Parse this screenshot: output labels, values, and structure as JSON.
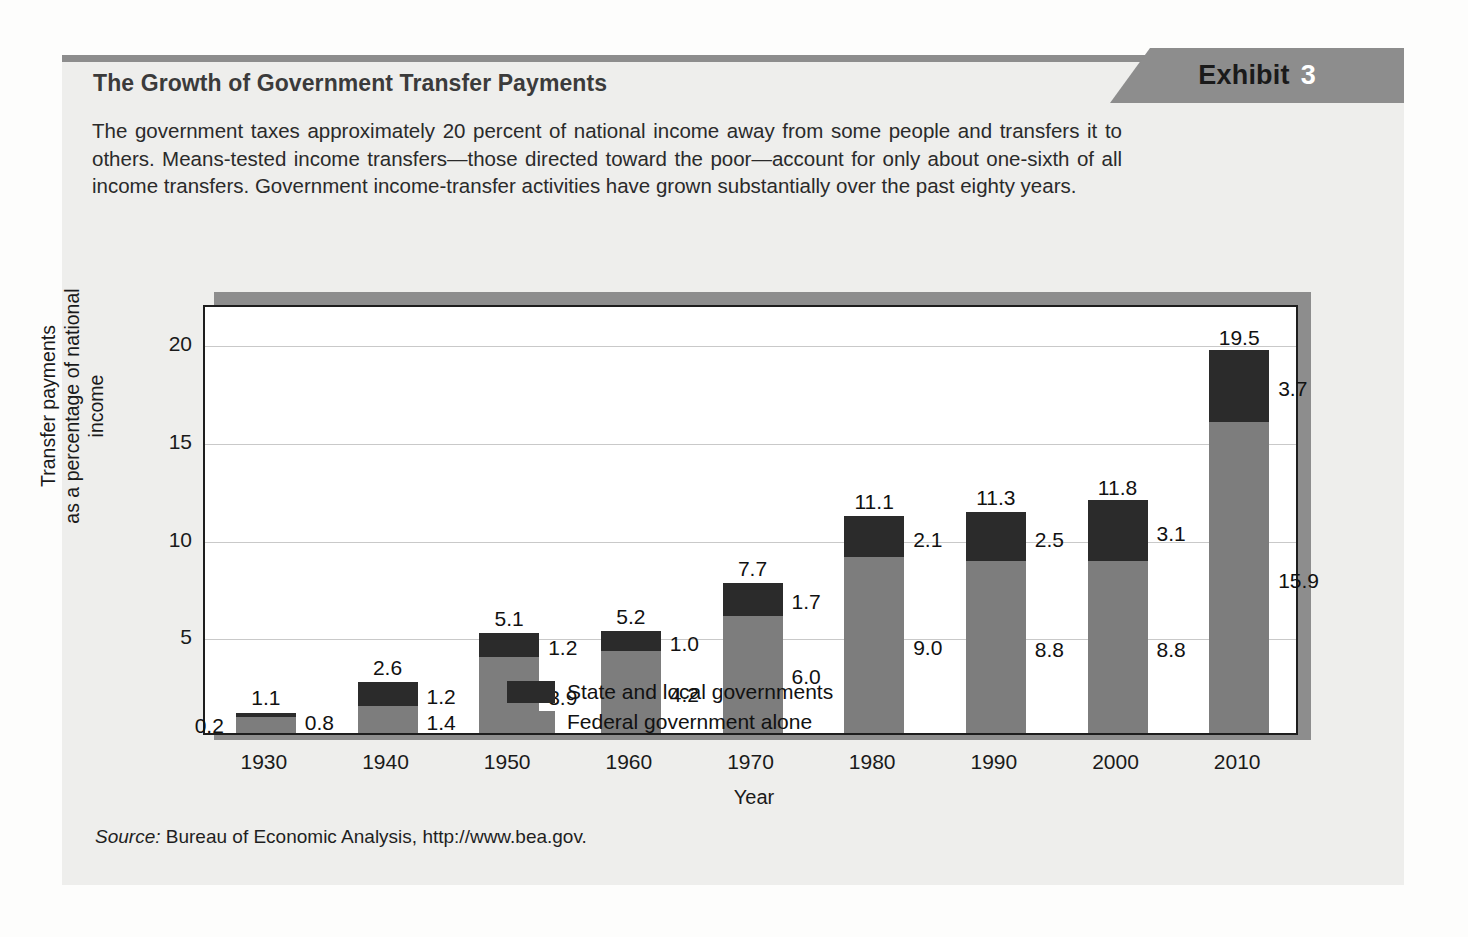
{
  "exhibit": {
    "badge_word": "Exhibit",
    "badge_number": "3",
    "title": "The Growth of Government Transfer Payments",
    "body": "The government taxes approximately 20 percent of national income away from some people and transfers it to others. Means-tested income transfers—those directed toward the poor—account for only about one-sixth of all income transfers. Government income-transfer activities have grown substantially over the past eighty years.",
    "source_label": "Source:",
    "source_text": " Bureau of Economic Analysis, http://www.bea.gov."
  },
  "colors": {
    "state_local": "#2b2b2b",
    "federal": "#7d7d7d",
    "banner": "#8d8d8d",
    "card_bg": "#eeeeec",
    "plot_bg": "#ffffff",
    "axis": "#1d1d1d",
    "grid": "#c9c9c9"
  },
  "chart_data": {
    "type": "bar",
    "subtype": "stacked",
    "title": "",
    "xlabel": "Year",
    "ylabel": "Transfer payments as a percentage of national income",
    "ylabel_line1": "Transfer payments",
    "ylabel_line2": "as a percentage of national income",
    "categories": [
      "1930",
      "1940",
      "1950",
      "1960",
      "1970",
      "1980",
      "1990",
      "2000",
      "2010"
    ],
    "ylim": [
      0,
      22
    ],
    "yticks": [
      5,
      10,
      15,
      20
    ],
    "ytick_labels": [
      "5",
      "10",
      "15",
      "20"
    ],
    "grid": true,
    "legend_position": "inside-upper-left",
    "series": [
      {
        "name": "State and local governments",
        "color": "#2b2b2b",
        "values": [
          0.2,
          1.2,
          1.2,
          1.0,
          1.7,
          2.1,
          2.5,
          3.1,
          3.7
        ],
        "labels": [
          "0.2",
          "1.2",
          "1.2",
          "1.0",
          "1.7",
          "2.1",
          "2.5",
          "3.1",
          "3.7"
        ]
      },
      {
        "name": "Federal government alone",
        "color": "#7d7d7d",
        "values": [
          0.8,
          1.4,
          3.9,
          4.2,
          6.0,
          9.0,
          8.8,
          8.8,
          15.9
        ],
        "labels": [
          "0.8",
          "1.4",
          "3.9",
          "4.2",
          "6.0",
          "9.0",
          "8.8",
          "8.8",
          "15.9"
        ]
      }
    ],
    "totals": [
      1.1,
      2.6,
      5.1,
      5.2,
      7.7,
      11.1,
      11.3,
      11.8,
      19.5
    ],
    "total_labels": [
      "1.1",
      "2.6",
      "5.1",
      "5.2",
      "7.7",
      "11.1",
      "11.3",
      "11.8",
      "19.5"
    ]
  }
}
